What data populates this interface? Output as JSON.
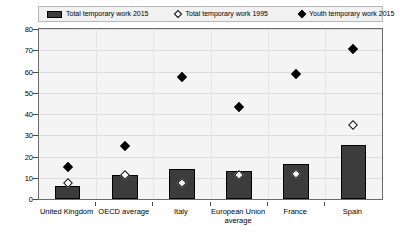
{
  "chart_data": {
    "type": "bar",
    "title": "",
    "xlabel": "",
    "ylabel": "",
    "ylim": [
      0,
      80
    ],
    "yticks": [
      0,
      10,
      20,
      30,
      40,
      50,
      60,
      70,
      80
    ],
    "grid": true,
    "legend_position": "top",
    "categories": [
      "United Kingdom",
      "OECD average",
      "Italy",
      "European Union average",
      "France",
      "Spain"
    ],
    "series": [
      {
        "name": "Total temporary work 2015",
        "marker": "bar",
        "color": "#3c3c3c",
        "values": [
          6,
          11.5,
          14,
          13,
          16.5,
          25.5
        ]
      },
      {
        "name": "Total temporary work 1995",
        "marker": "open-diamond",
        "color": "#ffffff",
        "values": [
          7.5,
          11.5,
          7.5,
          11.5,
          12,
          35
        ]
      },
      {
        "name": "Youth temporary work 2015",
        "marker": "filled-diamond",
        "color": "#000000",
        "values": [
          15,
          25,
          57.5,
          43.5,
          59,
          70.5
        ]
      }
    ]
  },
  "legend": {
    "items": [
      {
        "label": "Total temporary work 2015",
        "icon": "bar-swatch"
      },
      {
        "label": "Total temporary work 1995",
        "icon": "open-diamond-icon"
      },
      {
        "label": "Youth temporary work 2015",
        "icon": "filled-diamond-icon"
      }
    ]
  },
  "yaxis": {
    "labels": [
      "80",
      "70",
      "60",
      "50",
      "40",
      "30",
      "20",
      "10",
      "0"
    ]
  },
  "xaxis": {
    "labels": [
      {
        "line1": "United Kingdom",
        "line2": ""
      },
      {
        "line1": "OECD average",
        "line2": ""
      },
      {
        "line1": "Italy",
        "line2": ""
      },
      {
        "line1": "European Union",
        "line2": "average"
      },
      {
        "line1": "France",
        "line2": ""
      },
      {
        "line1": "Spain",
        "line2": ""
      }
    ]
  }
}
